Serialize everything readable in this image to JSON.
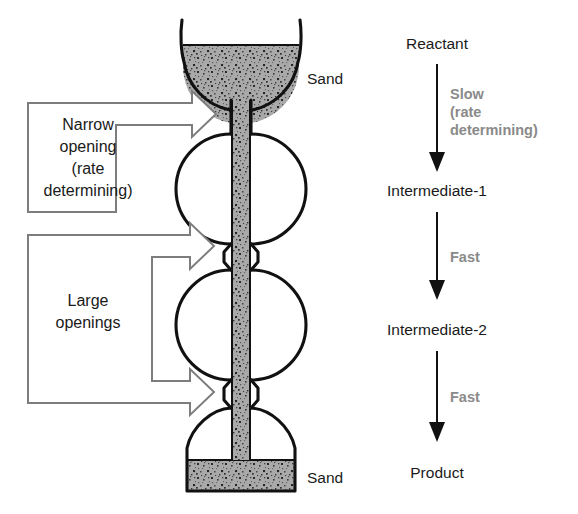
{
  "figure": {
    "apparatus": {
      "name": "sand-apparatus",
      "top_sand_label": "Sand",
      "bottom_sand_label": "Sand",
      "sand_color": "#a9a9a9",
      "outline_color": "#111111"
    },
    "callouts": [
      {
        "name": "narrow-opening-callout",
        "lines": [
          "Narrow",
          "opening",
          "(rate",
          "determining)"
        ],
        "arrow_heads": 1,
        "stroke_color": "#7d7d7d"
      },
      {
        "name": "large-openings-callout",
        "lines": [
          "Large",
          "openings"
        ],
        "arrow_heads": 2,
        "stroke_color": "#7d7d7d"
      }
    ],
    "reaction_scheme": {
      "name": "reaction-scheme",
      "species": [
        "Reactant",
        "Intermediate-1",
        "Intermediate-2",
        "Product"
      ],
      "steps": [
        {
          "label_lines": [
            "Slow",
            "(rate",
            "determining)"
          ],
          "speed": "Slow"
        },
        {
          "label_lines": [
            "Fast"
          ],
          "speed": "Fast"
        },
        {
          "label_lines": [
            "Fast"
          ],
          "speed": "Fast"
        }
      ],
      "step_label_color": "#8a8a8a",
      "species_color": "#1a1a1a"
    }
  }
}
